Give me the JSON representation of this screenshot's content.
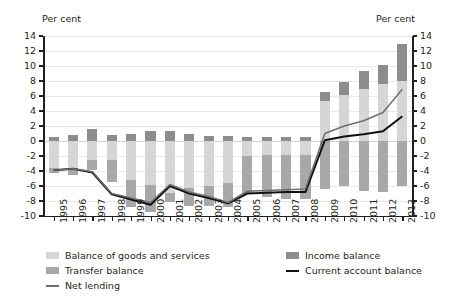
{
  "axis": {
    "unit_left": "Per cent",
    "unit_right": "Per cent",
    "y_ticks": [
      14,
      12,
      10,
      8,
      6,
      4,
      2,
      0,
      -2,
      -4,
      -6,
      -8,
      -10
    ]
  },
  "legend": {
    "items": [
      {
        "label": "Balance of goods and services",
        "swatch": "bar",
        "color": "#d6d6d6",
        "key": "goods"
      },
      {
        "label": "Income balance",
        "swatch": "bar",
        "color": "#8d8d8d",
        "key": "income"
      },
      {
        "label": "Transfer balance",
        "swatch": "bar",
        "color": "#a8a8a8",
        "key": "transfer"
      },
      {
        "label": "Current account balance",
        "swatch": "line",
        "color": "#111111",
        "key": "current_account"
      },
      {
        "label": "Net lending",
        "swatch": "line",
        "color": "#6f6f6f",
        "key": "net_lending"
      }
    ]
  },
  "chart_data": {
    "type": "bar",
    "title": "",
    "subtitle": "",
    "xlabel": "",
    "ylabel": "Per cent",
    "ylim": [
      -10,
      14
    ],
    "grid": true,
    "stacked": true,
    "legend_position": "bottom",
    "categories": [
      "1995",
      "1996",
      "1997",
      "1998",
      "1999",
      "2000",
      "2001",
      "2002",
      "2003",
      "2004",
      "2005",
      "2006",
      "2007",
      "2008",
      "2009",
      "2010",
      "2011",
      "2012",
      "2013"
    ],
    "series": [
      {
        "name": "Balance of goods and services",
        "type": "bar",
        "color": "#d6d6d6",
        "values": [
          -3.6,
          -3.6,
          -2.5,
          -2.5,
          -5.2,
          -5.8,
          -6.9,
          -6.2,
          -6.0,
          -5.6,
          -2.0,
          -1.8,
          -1.8,
          -1.8,
          5.3,
          6.2,
          7.0,
          7.6,
          8.0
        ]
      },
      {
        "name": "Income balance",
        "type": "bar",
        "color": "#8d8d8d",
        "values": [
          0.6,
          0.8,
          1.6,
          0.8,
          0.9,
          1.3,
          1.3,
          1.0,
          0.7,
          0.7,
          0.5,
          0.5,
          0.5,
          0.5,
          1.3,
          1.7,
          2.3,
          2.6,
          5.0
        ]
      },
      {
        "name": "Transfer balance",
        "type": "bar",
        "color": "#a8a8a8",
        "values": [
          -0.7,
          -0.9,
          -1.4,
          -2.9,
          -3.6,
          -3.7,
          -1.2,
          -2.4,
          -2.6,
          -3.2,
          -5.0,
          -5.6,
          -5.9,
          -5.9,
          -6.4,
          -6.0,
          -6.7,
          -6.8,
          -6.0
        ]
      },
      {
        "name": "Current account balance",
        "type": "line",
        "color": "#111111",
        "values": [
          -3.9,
          -3.7,
          -4.2,
          -7.1,
          -7.8,
          -8.5,
          -6.0,
          -7.0,
          -7.6,
          -8.3,
          -7.0,
          -6.9,
          -6.8,
          -6.8,
          0.1,
          0.6,
          0.9,
          1.3,
          3.3
        ]
      },
      {
        "name": "Net lending",
        "type": "line",
        "color": "#6f6f6f",
        "values": [
          -3.9,
          -3.7,
          -4.1,
          -7.0,
          -7.6,
          -8.2,
          -5.8,
          -6.8,
          -7.4,
          -8.2,
          -6.7,
          -6.6,
          -6.5,
          -6.4,
          1.0,
          2.0,
          2.7,
          3.8,
          6.9
        ]
      }
    ]
  }
}
